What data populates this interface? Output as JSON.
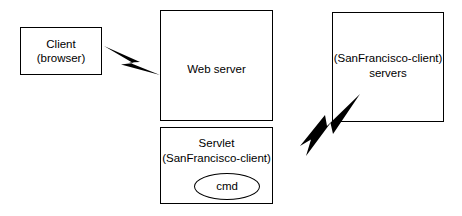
{
  "diagram": {
    "type": "architecture-block-diagram",
    "background_color": "#ffffff",
    "stroke_color": "#000000",
    "nodes": [
      {
        "id": "client",
        "lines": [
          "Client",
          "(browser)"
        ],
        "shape": "rectangle"
      },
      {
        "id": "web_server",
        "lines": [
          "Web server"
        ],
        "shape": "rectangle"
      },
      {
        "id": "servlet",
        "lines": [
          "Servlet",
          "(SanFrancisco-client)"
        ],
        "shape": "rectangle"
      },
      {
        "id": "cmd",
        "lines": [
          "cmd"
        ],
        "shape": "ellipse"
      },
      {
        "id": "sf_servers",
        "lines": [
          "(SanFrancisco-client)",
          "servers"
        ],
        "shape": "rectangle"
      }
    ],
    "connectors": [
      {
        "id": "client-to-web-server",
        "style": "lightning-bolt",
        "from": "client",
        "to": "web_server"
      },
      {
        "id": "servlet-to-sf-servers",
        "style": "lightning-bolt",
        "from": "servlet",
        "to": "sf_servers"
      }
    ],
    "labels": {
      "client_line1": "Client",
      "client_line2": "(browser)",
      "web_server_line1": "Web server",
      "servlet_line1": "Servlet",
      "servlet_line2": "(SanFrancisco-client)",
      "cmd_label": "cmd",
      "sf_servers_line1": "(SanFrancisco-client)",
      "sf_servers_line2": "servers"
    }
  }
}
